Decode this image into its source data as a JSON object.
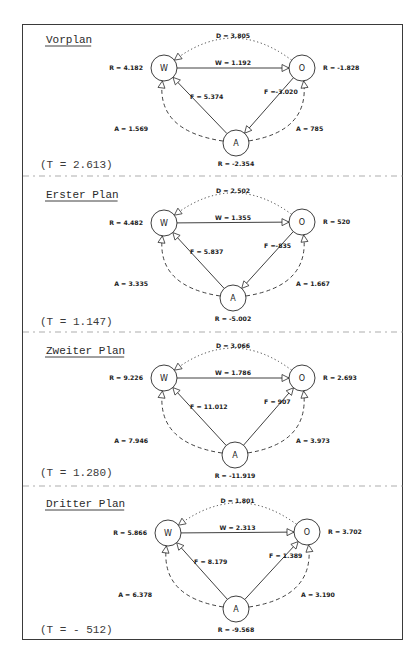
{
  "document": {
    "panels": [
      {
        "title": "Vorplan",
        "t_label": "(T = 2.613)",
        "nodes": {
          "W": "W",
          "O": "O",
          "A": "A"
        },
        "labels": {
          "D": "D = 3.805",
          "W": "W = 1.192",
          "F_WA": "F = 5.374",
          "F_OA": "F =-3.020",
          "A_W": "A = 1.569",
          "A_O": "A = 785",
          "R_W": "R = 4.182",
          "R_O": "R = -1.828",
          "R_A": "R = -2.354"
        },
        "f_direction": "O-to-A",
        "f_left": "A-to-W"
      },
      {
        "title": "Erster Plan",
        "t_label": "(T = 1.147)",
        "nodes": {
          "W": "W",
          "O": "O",
          "A": "A"
        },
        "labels": {
          "D": "D = 2.502",
          "W": "W = 1.355",
          "F_WA": "F = 5.837",
          "F_OA": "F =-835",
          "A_W": "A = 3.335",
          "A_O": "A = 1.667",
          "R_W": "R = 4.482",
          "R_O": "R = 520",
          "R_A": "R = -5.002"
        },
        "f_direction": "O-to-A",
        "f_left": "A-to-W"
      },
      {
        "title": "Zweiter Plan",
        "t_label": "(T = 1.280)",
        "nodes": {
          "W": "W",
          "O": "O",
          "A": "A"
        },
        "labels": {
          "D": "D = 3.066",
          "W": "W = 1.786",
          "F_WA": "F = 11.012",
          "F_OA": "F = 907",
          "A_W": "A = 7.946",
          "A_O": "A = 3.973",
          "R_W": "R = 9.226",
          "R_O": "R = 2.693",
          "R_A": "R = -11.919"
        },
        "f_direction": "A-to-O",
        "f_left": "A-to-W"
      },
      {
        "title": "Dritter Plan",
        "t_label": "(T = - 512)",
        "nodes": {
          "W": "W",
          "O": "O",
          "A": "A"
        },
        "labels": {
          "D": "D = 1.801",
          "W": "W = 2.313",
          "F_WA": "F = 8.179",
          "F_OA": "F = 1.389",
          "A_W": "A = 6.378",
          "A_O": "A = 3.190",
          "R_W": "R = 5.866",
          "R_O": "R = 3.702",
          "R_A": "R = -9.568"
        },
        "f_direction": "A-to-O",
        "f_left": "A-to-W"
      }
    ],
    "colors": {
      "ink": "#2a2a2a",
      "faint": "#8a8a8a"
    }
  }
}
